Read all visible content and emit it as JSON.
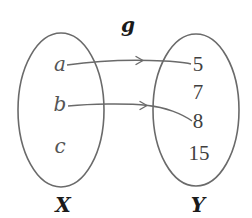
{
  "diagram": {
    "function_label": "g",
    "domain": {
      "name": "X",
      "elements": [
        "a",
        "b",
        "c"
      ]
    },
    "codomain": {
      "name": "Y",
      "elements": [
        "5",
        "7",
        "8",
        "15"
      ]
    },
    "mappings": [
      {
        "from": "a",
        "to": "5"
      },
      {
        "from": "b",
        "to": "8"
      }
    ],
    "colors": {
      "outline": "#6a6a6a",
      "element_text": "#444444",
      "label_text": "#1a1a1a"
    }
  }
}
